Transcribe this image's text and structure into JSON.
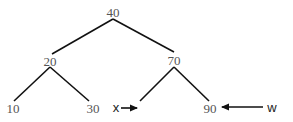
{
  "diagram": {
    "type": "binary-search-tree",
    "nodes": {
      "root": {
        "label": "40"
      },
      "left": {
        "label": "20"
      },
      "right": {
        "label": "70"
      },
      "left_left": {
        "label": "10"
      },
      "left_right": {
        "label": "30"
      },
      "right_left": {
        "label": ""
      },
      "right_right": {
        "label": "90"
      }
    },
    "edges": [
      [
        "40",
        "20"
      ],
      [
        "40",
        "70"
      ],
      [
        "20",
        "10"
      ],
      [
        "20",
        "30"
      ],
      [
        "70",
        "x-empty"
      ],
      [
        "70",
        "90"
      ]
    ],
    "pointers": {
      "x": {
        "label": "x",
        "points_to": "empty left child of 70"
      },
      "w": {
        "label": "w",
        "points_to": "90"
      }
    }
  }
}
